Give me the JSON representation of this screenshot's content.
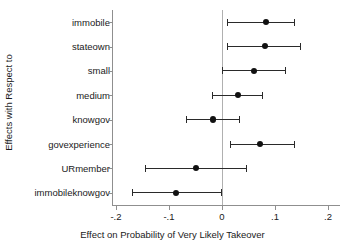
{
  "chart_data": {
    "type": "scatter",
    "subtype": "coefficient-plot-with-confidence-intervals",
    "title": "",
    "xlabel": "Effect on Probability of Very Likely Takeover",
    "ylabel": "Effects with Respect to",
    "xlim": [
      -0.2,
      0.2
    ],
    "xticks": [
      -0.2,
      -0.1,
      0,
      0.1,
      0.2
    ],
    "xticklabels": [
      "-.2",
      "-.1",
      "0",
      ".1",
      ".2"
    ],
    "grid": false,
    "legend": false,
    "zero_reference_line": 0,
    "categories": [
      "immobile",
      "stateown",
      "small",
      "medium",
      "knowgov",
      "govexperience",
      "URmember",
      "immobileknowgov"
    ],
    "values": [
      0.083,
      0.081,
      0.061,
      0.03,
      -0.017,
      0.072,
      -0.049,
      -0.087
    ],
    "ci_low": [
      0.009,
      0.01,
      0.0,
      -0.019,
      -0.067,
      0.016,
      -0.145,
      -0.17
    ],
    "ci_high": [
      0.136,
      0.147,
      0.119,
      0.075,
      0.033,
      0.135,
      0.045,
      -0.002
    ],
    "points": [
      {
        "label": "immobile",
        "estimate": 0.083,
        "ci_low": 0.009,
        "ci_high": 0.136
      },
      {
        "label": "stateown",
        "estimate": 0.081,
        "ci_low": 0.01,
        "ci_high": 0.147
      },
      {
        "label": "small",
        "estimate": 0.061,
        "ci_low": 0.0,
        "ci_high": 0.119
      },
      {
        "label": "medium",
        "estimate": 0.03,
        "ci_low": -0.019,
        "ci_high": 0.075
      },
      {
        "label": "knowgov",
        "estimate": -0.017,
        "ci_low": -0.067,
        "ci_high": 0.033
      },
      {
        "label": "govexperience",
        "estimate": 0.072,
        "ci_low": 0.016,
        "ci_high": 0.135
      },
      {
        "label": "URmember",
        "estimate": -0.049,
        "ci_low": -0.145,
        "ci_high": 0.045
      },
      {
        "label": "immobileknowgov",
        "estimate": -0.087,
        "ci_low": -0.17,
        "ci_high": -0.002
      }
    ],
    "colors": {
      "marker": "#111111",
      "interval": "#2a2a2a",
      "axis": "#8f8f8f",
      "reference_line": "#b0b0b0",
      "background": "#ffffff",
      "text": "#1a1a1a"
    }
  }
}
